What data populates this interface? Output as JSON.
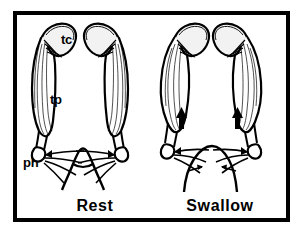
{
  "figure": {
    "type": "anatomical-line-drawing",
    "background_color": "#ffffff",
    "ink_color": "#000000",
    "frame": {
      "style": "thick rectangular border",
      "color": "#000000",
      "x": 13,
      "y": 11,
      "width": 277,
      "height": 211,
      "stroke_width": 4
    },
    "panels": [
      {
        "id": "rest",
        "caption": "Rest",
        "caption_x": 95,
        "caption_y": 211,
        "state": "relaxed",
        "palate_shape": "narrow tented peak",
        "muscle_shape": "slender fusiform",
        "arrows": []
      },
      {
        "id": "swallow",
        "caption": "Swallow",
        "caption_x": 220,
        "caption_y": 211,
        "state": "contracted",
        "palate_shape": "broad elevated dome",
        "muscle_shape": "bulged contracted belly",
        "arrows": [
          {
            "name": "muscle-contraction-arrow-left",
            "direction": "up",
            "x": 182,
            "y": 119
          },
          {
            "name": "muscle-contraction-arrow-right",
            "direction": "up",
            "x": 237,
            "y": 119
          },
          {
            "name": "palate-tension-arrow-left",
            "direction": "right",
            "x": 196,
            "y": 168
          },
          {
            "name": "palate-tension-arrow-right",
            "direction": "left",
            "x": 228,
            "y": 168
          }
        ]
      }
    ],
    "labels": [
      {
        "id": "tc",
        "text": "tc",
        "meaning": "tensor cartilage / torus cartilage",
        "x": 61,
        "y": 43
      },
      {
        "id": "tp",
        "text": "tp",
        "meaning": "tensor palatini muscle",
        "x": 50,
        "y": 103
      },
      {
        "id": "ph",
        "text": "ph",
        "meaning": "pterygoid hamulus",
        "x": 24,
        "y": 166
      }
    ],
    "captions": {
      "rest": "Rest",
      "swallow": "Swallow"
    }
  }
}
